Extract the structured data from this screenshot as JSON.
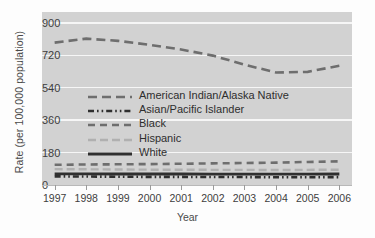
{
  "chart_data": {
    "type": "line",
    "title": "",
    "xlabel": "Year",
    "ylabel": "Rate (per 100,000 population)",
    "x": [
      1997,
      1998,
      1999,
      2000,
      2001,
      2002,
      2003,
      2004,
      2005,
      2006
    ],
    "xtick_labels": [
      "1997",
      "1998",
      "1999",
      "2000",
      "2001",
      "2002",
      "2003",
      "2004",
      "2005",
      "2006"
    ],
    "ytick_labels": [
      "0",
      "180",
      "360",
      "540",
      "720",
      "900"
    ],
    "yticks": [
      0,
      180,
      360,
      540,
      720,
      900
    ],
    "ylim": [
      0,
      960
    ],
    "xlim": [
      1996.6,
      2006.4
    ],
    "grid": "horizontal",
    "legend_position": "center-left",
    "plot_background": "#d2d2d2",
    "gridline_color": "#f6f6f6",
    "series": [
      {
        "name": "American Indian/Alaska Native",
        "style": "long-dash",
        "color": "#6e6e6e",
        "values": [
          790,
          812,
          800,
          778,
          752,
          718,
          668,
          624,
          628,
          662
        ]
      },
      {
        "name": "Asian/Pacific Islander",
        "style": "dash-dot-dot",
        "color": "#2f2f2f",
        "values": [
          48,
          47,
          46,
          45,
          45,
          44,
          44,
          43,
          43,
          44
        ]
      },
      {
        "name": "Black",
        "style": "dash",
        "color": "#6e6e6e",
        "values": [
          112,
          114,
          115,
          116,
          118,
          120,
          122,
          124,
          128,
          131
        ]
      },
      {
        "name": "Hispanic",
        "style": "light-dash",
        "color": "#b0b0b0",
        "values": [
          88,
          87,
          86,
          85,
          85,
          84,
          84,
          83,
          84,
          85
        ]
      },
      {
        "name": "White",
        "style": "solid",
        "color": "#2f2f2f",
        "values": [
          62,
          62,
          61,
          61,
          61,
          60,
          60,
          60,
          60,
          61
        ]
      }
    ]
  }
}
